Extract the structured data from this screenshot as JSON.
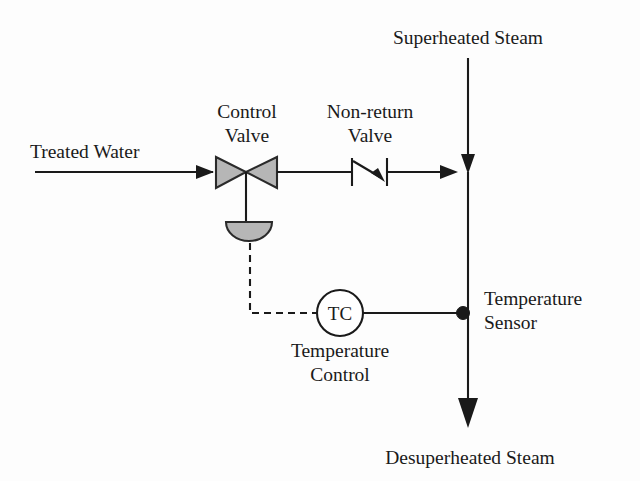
{
  "diagram": {
    "type": "process-flow-diagram",
    "canvas": {
      "width": 640,
      "height": 481,
      "background": "#fdfdfd"
    },
    "colors": {
      "line": "#1a1a1a",
      "valve_fill": "#b6b6b6",
      "valve_stroke": "#2a2a2a",
      "bubble_fill": "#ffffff",
      "page_background": "#fdfdfd"
    },
    "labels": {
      "treated_water": "Treated Water",
      "control_valve_line1": "Control",
      "control_valve_line2": "Valve",
      "non_return_valve_line1": "Non-return",
      "non_return_valve_line2": "Valve",
      "superheated_steam": "Superheated Steam",
      "temperature_sensor_line1": "Temperature",
      "temperature_sensor_line2": "Sensor",
      "temperature_control_line1": "Temperature",
      "temperature_control_line2": "Control",
      "instrument_tag": "TC",
      "desuperheated_steam": "Desuperheated Steam"
    },
    "geometry": {
      "water_line": {
        "x1": 35,
        "y1": 172,
        "x2": 215,
        "y2": 172
      },
      "valve_outlet_line": {
        "x1": 277,
        "y1": 172,
        "x2": 455,
        "y2": 172
      },
      "steam_line": {
        "x1": 468,
        "y1": 58,
        "x2": 468,
        "y2": 172
      },
      "mixed_line": {
        "x1": 468,
        "y1": 172,
        "x2": 468,
        "y2": 412
      },
      "valve_stem": {
        "x1": 246,
        "y1": 172,
        "x2": 246,
        "y2": 222
      },
      "signal_path": "M 250 243 L 250 313 L 317 313",
      "sensor_link": {
        "x1": 363,
        "y1": 313,
        "x2": 463,
        "y2": 313
      },
      "sensor_dot": {
        "cx": 463,
        "cy": 313,
        "r": 6.5
      },
      "instrument_bubble": {
        "cx": 340,
        "cy": 313,
        "rx": 23,
        "ry": 23
      },
      "valve_left_triangle": "216,157 216,188 246,172",
      "valve_right_triangle": "277,157 277,188 246,172",
      "actuator": "M 226 222 L 272 222 A 23 19 0 0 1 226 222 Z",
      "check_valve_left_bar": {
        "x1": 352,
        "y1": 158,
        "x2": 352,
        "y2": 186
      },
      "check_valve_right_bar": {
        "x1": 387,
        "y1": 158,
        "x2": 387,
        "y2": 186
      },
      "check_valve_diagonal": {
        "x1": 353,
        "y1": 161,
        "x2": 384,
        "y2": 180
      }
    },
    "label_positions": {
      "treated_water": {
        "x": 30,
        "y": 158,
        "anchor": "start"
      },
      "control_valve": {
        "x": 246,
        "y": 116,
        "anchor": "middle",
        "line_gap": 24
      },
      "non_return_valve": {
        "x": 369,
        "y": 116,
        "anchor": "middle",
        "line_gap": 24
      },
      "superheated_steam": {
        "x": 468,
        "y": 42,
        "anchor": "middle"
      },
      "temperature_sensor": {
        "x": 484,
        "y": 304,
        "anchor": "start",
        "line_gap": 24
      },
      "temperature_control": {
        "x": 340,
        "y": 356,
        "anchor": "middle",
        "line_gap": 24
      },
      "instrument_tag": {
        "x": 340,
        "y": 320,
        "anchor": "middle"
      },
      "desuperheated_steam": {
        "x": 470,
        "y": 465,
        "anchor": "middle"
      }
    },
    "flows": [
      {
        "name": "treated-water-inlet",
        "direction": "right",
        "label": "Treated Water"
      },
      {
        "name": "superheated-steam-inlet",
        "direction": "down",
        "label": "Superheated Steam"
      },
      {
        "name": "desuperheated-steam-outlet",
        "direction": "down",
        "label": "Desuperheated Steam"
      }
    ],
    "components": [
      {
        "name": "control-valve",
        "label": "Control Valve",
        "symbol": "globe-valve-with-diaphragm-actuator"
      },
      {
        "name": "non-return-valve",
        "label": "Non-return Valve",
        "symbol": "check-valve"
      },
      {
        "name": "temperature-controller",
        "label": "Temperature Control",
        "tag": "TC",
        "symbol": "instrument-bubble"
      },
      {
        "name": "temperature-sensor",
        "label": "Temperature Sensor",
        "symbol": "process-connection-dot"
      }
    ]
  }
}
